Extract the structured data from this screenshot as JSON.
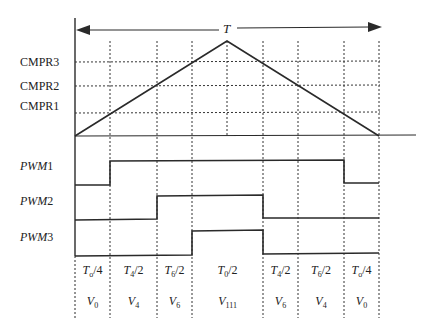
{
  "diagram": {
    "title_period_label": "T",
    "compare_levels": [
      {
        "label": "CMPR3",
        "y": 62
      },
      {
        "label": "CMPR2",
        "y": 86
      },
      {
        "label": "CMPR1",
        "y": 113
      }
    ],
    "pwm_signals": [
      {
        "name": "PWM",
        "index": "1",
        "label_y": 166
      },
      {
        "name": "PWM",
        "index": "2",
        "label_y": 201
      },
      {
        "name": "PWM",
        "index": "3",
        "label_y": 237
      }
    ],
    "intervals": [
      {
        "time_main": "T",
        "time_sub": "o",
        "time_den": "/4",
        "vector_main": "V",
        "vector_sub": "0"
      },
      {
        "time_main": "T",
        "time_sub": "4",
        "time_den": "/2",
        "vector_main": "V",
        "vector_sub": "4"
      },
      {
        "time_main": "T",
        "time_sub": "6",
        "time_den": "/2",
        "vector_main": "V",
        "vector_sub": "6"
      },
      {
        "time_main": "T",
        "time_sub": "0",
        "time_den": "/2",
        "vector_main": "V",
        "vector_sub": "111"
      },
      {
        "time_main": "T",
        "time_sub": "4",
        "time_den": "/2",
        "vector_main": "V",
        "vector_sub": "6"
      },
      {
        "time_main": "T",
        "time_sub": "6",
        "time_den": "/2",
        "vector_main": "V",
        "vector_sub": "4"
      },
      {
        "time_main": "T",
        "time_sub": "o",
        "time_den": "/4",
        "vector_main": "V",
        "vector_sub": "0"
      }
    ],
    "line_color": "#2a2a2a"
  }
}
